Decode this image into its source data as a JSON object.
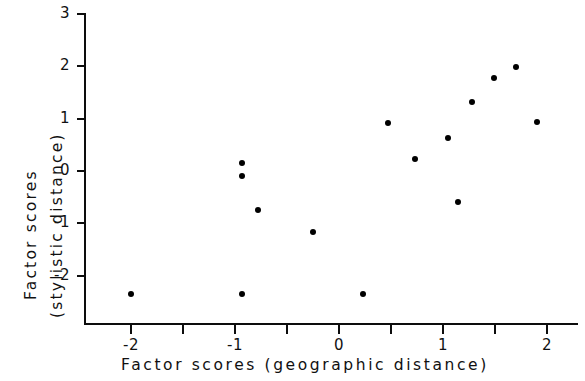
{
  "chart_data": {
    "type": "scatter",
    "title": "",
    "xlabel": "Factor  scores   (geographic  distance)",
    "ylabel_line1": "Factor  scores",
    "ylabel_line2": "(stylistic  distance)",
    "xlim": [
      -2.45,
      2.3
    ],
    "ylim": [
      -2.62,
      3.0
    ],
    "grid": false,
    "legend": null,
    "xticks": [
      -2,
      -1,
      0,
      1,
      2
    ],
    "xticklabels": [
      "-2",
      "-1",
      "0",
      "1",
      "2"
    ],
    "xminorticks": [
      -2.5,
      -1.5,
      -0.5,
      0.5,
      1.5
    ],
    "yticks": [
      3,
      2,
      1,
      0,
      -1,
      -2
    ],
    "yticklabels": [
      "3",
      "2",
      "1",
      "0",
      "-1",
      "-2"
    ],
    "marker": "filled-circle",
    "marker_color": "#000000",
    "points": [
      {
        "x": -2.0,
        "y": -2.35
      },
      {
        "x": -0.93,
        "y": 0.15
      },
      {
        "x": -0.93,
        "y": -0.1
      },
      {
        "x": -0.78,
        "y": -0.75
      },
      {
        "x": -0.93,
        "y": -2.35
      },
      {
        "x": -0.25,
        "y": -1.17
      },
      {
        "x": 0.23,
        "y": -2.35
      },
      {
        "x": 0.47,
        "y": 0.92
      },
      {
        "x": 0.73,
        "y": 0.23
      },
      {
        "x": 1.05,
        "y": 0.63
      },
      {
        "x": 1.14,
        "y": -0.6
      },
      {
        "x": 1.28,
        "y": 1.32
      },
      {
        "x": 1.49,
        "y": 1.78
      },
      {
        "x": 1.7,
        "y": 1.99
      },
      {
        "x": 1.9,
        "y": 0.94
      }
    ]
  },
  "axes": {
    "y_axis_label": "y-axis",
    "x_axis_label": "x-axis"
  }
}
